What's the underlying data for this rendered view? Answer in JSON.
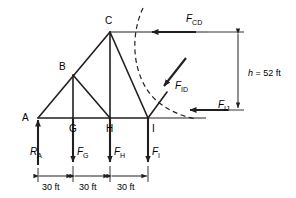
{
  "figure": {
    "type": "engineering-diagram",
    "colors": {
      "line": "#231f20",
      "background": "#ffffff"
    }
  },
  "nodes": [
    {
      "id": "A",
      "label": "A",
      "x": 38,
      "y": 118,
      "label_x": 22,
      "label_y": 121
    },
    {
      "id": "B",
      "label": "B",
      "x": 73,
      "y": 75,
      "label_x": 59,
      "label_y": 70
    },
    {
      "id": "C",
      "label": "C",
      "x": 110,
      "y": 32,
      "label_x": 105,
      "label_y": 24
    },
    {
      "id": "G",
      "label": "G",
      "x": 73,
      "y": 118,
      "label_x": 69,
      "label_y": 132
    },
    {
      "id": "H",
      "label": "H",
      "x": 110,
      "y": 118,
      "label_x": 106,
      "label_y": 132
    },
    {
      "id": "I",
      "label": "I",
      "x": 148,
      "y": 118,
      "label_x": 152,
      "label_y": 132
    }
  ],
  "members": [
    {
      "name": "bottom-chord-A-I",
      "from": "A",
      "to": "I"
    },
    {
      "name": "top-chord-A-C",
      "from": "A",
      "to": "C"
    },
    {
      "name": "vertical-B-G",
      "from": "B",
      "to": "G"
    },
    {
      "name": "vertical-C-H",
      "from": "C",
      "to": "H"
    },
    {
      "name": "diagonal-B-H",
      "from": "B",
      "to": "H"
    },
    {
      "name": "diagonal-C-I",
      "from": "C",
      "to": "I"
    }
  ],
  "forces": [
    {
      "name": "F_CD",
      "base": "F",
      "sub": "CD",
      "label_x": 186,
      "label_y": 22,
      "direction": "left",
      "member": "CD"
    },
    {
      "name": "F_ID",
      "base": "F",
      "sub": "ID",
      "label_x": 175,
      "label_y": 89,
      "direction": "down-left",
      "member": "ID"
    },
    {
      "name": "F_IJ",
      "base": "F",
      "sub": "IJ",
      "label_x": 218,
      "label_y": 108,
      "direction": "left",
      "member": "IJ"
    },
    {
      "name": "R_A",
      "base": "R",
      "sub": "A",
      "label_x": 30,
      "label_y": 155,
      "direction": "up",
      "member": "support-A"
    },
    {
      "name": "F_G",
      "base": "F",
      "sub": "G",
      "label_x": 77,
      "label_y": 155,
      "direction": "down",
      "member": "load-G"
    },
    {
      "name": "F_H",
      "base": "F",
      "sub": "H",
      "label_x": 114,
      "label_y": 155,
      "direction": "down",
      "member": "load-H"
    },
    {
      "name": "F_I",
      "base": "F",
      "sub": "I",
      "label_x": 152,
      "label_y": 155,
      "direction": "down",
      "member": "load-I"
    }
  ],
  "dimensions": {
    "height": {
      "symbol": "h",
      "equals": "=",
      "value": "52 ft",
      "label_x": 248,
      "label_y": 76
    },
    "spans": [
      {
        "label": "30 ft",
        "label_x": 42,
        "label_y": 190,
        "from_x": 38,
        "to_x": 73
      },
      {
        "label": "30 ft",
        "label_x": 79,
        "label_y": 190,
        "from_x": 73,
        "to_x": 110
      },
      {
        "label": "30 ft",
        "label_x": 117,
        "label_y": 190,
        "from_x": 110,
        "to_x": 148
      }
    ]
  },
  "section_cut": {
    "name": "section-cut-curve",
    "style": "dashed",
    "cuts_members": [
      "CD",
      "ID",
      "IJ"
    ]
  }
}
